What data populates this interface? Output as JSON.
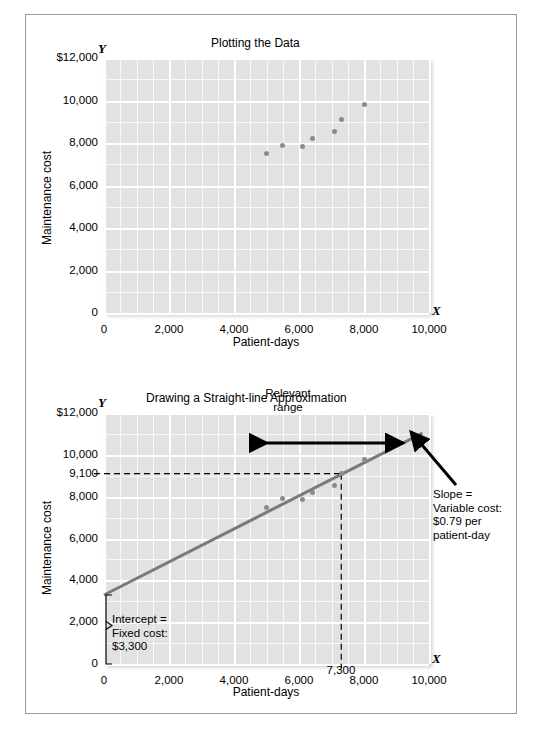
{
  "figure": {
    "background": "#ffffff",
    "border_color": "#9a9a9a",
    "plot_bg": "#e2e2e2",
    "grid_color": "#ffffff",
    "dot_color": "#8b8b8b",
    "line_color": "#7a7a7a"
  },
  "chart_data": [
    {
      "type": "scatter",
      "title": "Plotting the Data",
      "xlabel": "Patient-days",
      "ylabel": "Maintenance cost",
      "x_axis_letter": "X",
      "y_axis_letter": "Y",
      "xlim": [
        0,
        10000
      ],
      "ylim": [
        0,
        12000
      ],
      "grid": true,
      "xticks": [
        "0",
        "2,000",
        "4,000",
        "6,000",
        "8,000",
        "10,000"
      ],
      "xtick_values": [
        0,
        2000,
        4000,
        6000,
        8000,
        10000
      ],
      "yticks": [
        "0",
        "2,000",
        "4,000",
        "6,000",
        "8,000",
        "10,000",
        "$12,000"
      ],
      "ytick_values": [
        0,
        2000,
        4000,
        6000,
        8000,
        10000,
        12000
      ],
      "points": [
        {
          "x": 5000,
          "y": 7500
        },
        {
          "x": 5500,
          "y": 7900
        },
        {
          "x": 6100,
          "y": 7850
        },
        {
          "x": 6400,
          "y": 8200
        },
        {
          "x": 7100,
          "y": 8550
        },
        {
          "x": 7300,
          "y": 9100
        },
        {
          "x": 8000,
          "y": 9800
        }
      ]
    },
    {
      "type": "scatter",
      "title": "Drawing a Straight-line Approximation",
      "xlabel": "Patient-days",
      "ylabel": "Maintenance cost",
      "x_axis_letter": "X",
      "y_axis_letter": "Y",
      "xlim": [
        0,
        10000
      ],
      "ylim": [
        0,
        12000
      ],
      "grid": true,
      "xticks": [
        "0",
        "2,000",
        "4,000",
        "6,000",
        "8,000",
        "10,000"
      ],
      "xtick_values": [
        0,
        2000,
        4000,
        6000,
        8000,
        10000
      ],
      "yticks": [
        "0",
        "2,000",
        "4,000",
        "6,000",
        "8,000",
        "9,100",
        "10,000",
        "$12,000"
      ],
      "ytick_values": [
        0,
        2000,
        4000,
        6000,
        8000,
        9100,
        10000,
        12000
      ],
      "points": [
        {
          "x": 5000,
          "y": 7500
        },
        {
          "x": 5500,
          "y": 7900
        },
        {
          "x": 6100,
          "y": 7850
        },
        {
          "x": 6400,
          "y": 8200
        },
        {
          "x": 7100,
          "y": 8550
        },
        {
          "x": 7300,
          "y": 9100
        },
        {
          "x": 8000,
          "y": 9800
        }
      ],
      "fit_line": {
        "intercept": 3300,
        "slope": 0.79,
        "x_start": 0,
        "x_end": 9800
      },
      "guides": {
        "horizontal_value": 9100,
        "vertical_value": 7300,
        "vertical_label": "7,300",
        "horizontal_label": "9,100"
      },
      "relevant_range": {
        "label_line1": "Relevant",
        "label_line2": "range",
        "x_start": 5000,
        "x_end": 9200
      },
      "annotations": [
        {
          "name": "slope-annotation",
          "lines": [
            "Slope =",
            "Variable cost:",
            "$0.79 per",
            "patient-day"
          ]
        },
        {
          "name": "intercept-annotation",
          "lines": [
            "Intercept =",
            "Fixed cost:",
            "$3,300"
          ]
        }
      ]
    }
  ]
}
